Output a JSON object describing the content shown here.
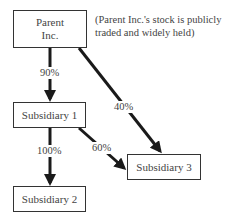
{
  "nodes": {
    "parent": {
      "line1": "Parent",
      "line2": "Inc."
    },
    "sub1": "Subsidiary 1",
    "sub2": "Subsidiary 2",
    "sub3": "Subsidiary 3"
  },
  "note": "(Parent Inc.'s stock is publicly traded and widely held)",
  "edges": [
    {
      "from": "Parent Inc.",
      "to": "Subsidiary 1",
      "label": "90%"
    },
    {
      "from": "Parent Inc.",
      "to": "Subsidiary 3",
      "label": "40%"
    },
    {
      "from": "Subsidiary 1",
      "to": "Subsidiary 2",
      "label": "100%"
    },
    {
      "from": "Subsidiary 1",
      "to": "Subsidiary 3",
      "label": "60%"
    }
  ]
}
